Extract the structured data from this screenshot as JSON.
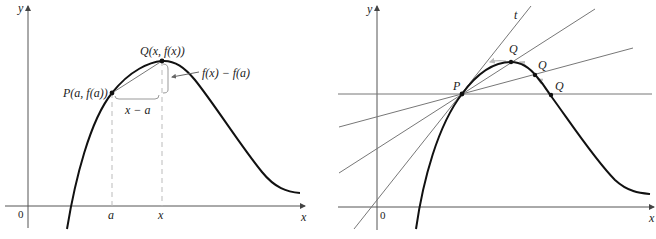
{
  "figures": [
    {
      "id": "secant-line-figure",
      "axes": {
        "x_label": "x",
        "y_label": "y",
        "origin_label": "0"
      },
      "points": {
        "P_label": "P(a, f(a))",
        "Q_label": "Q(x, f(x))"
      },
      "ticks": {
        "a_label": "a",
        "x_label": "x"
      },
      "annotations": {
        "run_label": "x − a",
        "rise_label": "f(x) − f(a)"
      }
    },
    {
      "id": "secants-approaching-tangent-figure",
      "axes": {
        "x_label": "x",
        "y_label": "y",
        "origin_label": "0"
      },
      "points": {
        "P_label": "P",
        "Q_labels": [
          "Q",
          "Q",
          "Q"
        ]
      },
      "tangent_label": "t"
    }
  ],
  "colors": {
    "curve": "#111111",
    "axes": "#555555",
    "secant_lines": "#777777",
    "dashed_guides": "#bbbbbb"
  }
}
